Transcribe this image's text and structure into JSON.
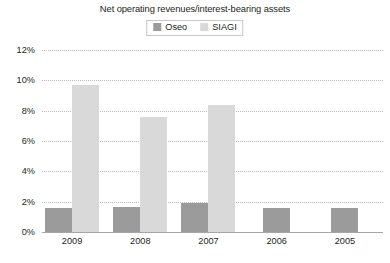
{
  "chart_data": {
    "type": "bar",
    "title": "Net operating revenues/interest-bearing assets",
    "xlabel": "",
    "ylabel": "",
    "categories": [
      "2009",
      "2008",
      "2007",
      "2006",
      "2005"
    ],
    "series": [
      {
        "name": "Oseo",
        "color": "#9b9b9b",
        "values": [
          1.6,
          1.65,
          1.9,
          1.6,
          1.6
        ]
      },
      {
        "name": "SIAGI",
        "color": "#d9d9d9",
        "values": [
          9.7,
          7.6,
          8.4,
          null,
          null
        ]
      }
    ],
    "ylim": [
      0,
      12
    ],
    "yticks": [
      0,
      2,
      4,
      6,
      8,
      10,
      12
    ],
    "ytick_labels": [
      "0%",
      "2%",
      "4%",
      "6%",
      "8%",
      "10%",
      "12%"
    ],
    "grid": true,
    "legend_position": "top-center",
    "legend_entries": [
      "Oseo",
      "SIAGI"
    ]
  },
  "colors": {
    "oseo": "#9b9b9b",
    "siagi": "#d9d9d9",
    "gridline": "#b9b9b9",
    "axis": "#a6a6a6",
    "text": "#231f20",
    "background": "#ffffff"
  }
}
